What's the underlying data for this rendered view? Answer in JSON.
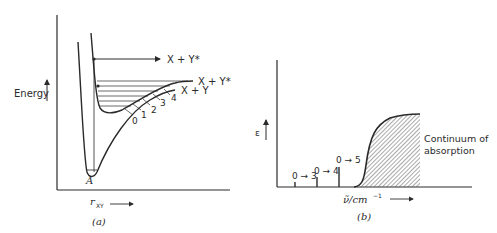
{
  "panel_a": {
    "caption": "(a)",
    "y_axis_label": "Energy",
    "x_axis_label": "r",
    "x_axis_subscript": "XY",
    "upper_arrow_label": "X + Y*",
    "excited_state_label": "X + Y*",
    "ground_state_label": "X + Y",
    "minimum_label": "A",
    "vibrational_levels": [
      "0",
      "1",
      "2",
      "3",
      "4"
    ]
  },
  "panel_b": {
    "caption": "(b)",
    "y_axis_label": "ε",
    "x_axis_label": "ν̃/cm",
    "x_axis_superscript": "−1",
    "transitions": [
      {
        "label": "0 → 3",
        "height": 5
      },
      {
        "label": "0 → 4",
        "height": 10
      },
      {
        "label": "0 → 5",
        "height": 20
      }
    ],
    "continuum_label_line1": "Continuum of",
    "continuum_label_line2": "absorption"
  }
}
